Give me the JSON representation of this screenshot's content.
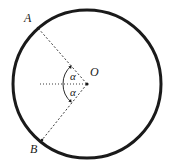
{
  "figure": {
    "type": "geometry-diagram",
    "background_color": "#ffffff",
    "stroke_color": "#1a1a1a",
    "labels": {
      "point_a": "A",
      "point_b": "B",
      "center_o": "O",
      "angle_upper": "α",
      "angle_lower": "α"
    },
    "geometry": {
      "circle": {
        "cx": 87,
        "cy": 84,
        "r": 74,
        "stroke_width": 3
      },
      "center_dot": {
        "cx": 87,
        "cy": 84,
        "r": 1.6
      },
      "point_a": {
        "x": 38,
        "y": 28
      },
      "point_b": {
        "x": 42,
        "y": 140
      },
      "reference_line": {
        "x1": 40,
        "y1": 84,
        "x2": 87,
        "y2": 84
      },
      "radius_oa": {
        "x1": 87,
        "y1": 84,
        "x2": 38,
        "y2": 28
      },
      "radius_ob": {
        "x1": 87,
        "y1": 84,
        "x2": 42,
        "y2": 140
      },
      "angle_arc_upper": {
        "radius": 24,
        "from_deg": 180,
        "to_deg": 131
      },
      "angle_arc_lower": {
        "radius": 24,
        "from_deg": 180,
        "to_deg": 229
      },
      "dash_pattern": "2 2",
      "dot_pattern": "1 2"
    }
  }
}
